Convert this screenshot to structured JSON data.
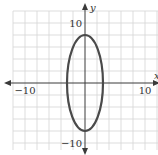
{
  "chart_data": {
    "type": "line",
    "title": "",
    "xlabel": "x",
    "ylabel": "y",
    "xlim": [
      -12,
      12
    ],
    "ylim": [
      -12,
      12
    ],
    "grid": true,
    "grid_step": 2,
    "x_tick_labels": [
      {
        "value": -10,
        "label": "−10"
      },
      {
        "value": 10,
        "label": "10"
      }
    ],
    "y_tick_labels": [
      {
        "value": 10,
        "label": "10"
      },
      {
        "value": -10,
        "label": "−10"
      }
    ],
    "series": [
      {
        "name": "ellipse",
        "shape": "ellipse",
        "equation": "x^2/9 + y^2/64 = 1",
        "center": [
          0,
          0
        ],
        "semi_axis_x": 3,
        "semi_axis_y": 8,
        "color": "#4a4a4a"
      }
    ]
  }
}
